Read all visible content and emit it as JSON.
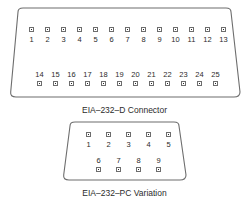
{
  "figure": {
    "name": "eia-232-connector-pinouts",
    "background_color": "#ffffff",
    "line_color": "#6d6d6d",
    "text_color": "#2b2b2b"
  },
  "connectors": [
    {
      "id": "db25",
      "caption": "EIA–232–D Connector",
      "shell_shape": "d-sub-trapezoid",
      "pin_count": 25,
      "rows": [
        {
          "id": "db25-row-top",
          "label_position": "below",
          "pins": [
            "1",
            "2",
            "3",
            "4",
            "5",
            "6",
            "7",
            "8",
            "9",
            "10",
            "11",
            "12",
            "13"
          ]
        },
        {
          "id": "db25-row-bottom",
          "label_position": "above",
          "pins": [
            "14",
            "15",
            "16",
            "17",
            "18",
            "19",
            "20",
            "21",
            "22",
            "23",
            "24",
            "25"
          ]
        }
      ]
    },
    {
      "id": "db9",
      "caption": "EIA–232–PC Variation",
      "shell_shape": "d-sub-trapezoid",
      "pin_count": 9,
      "rows": [
        {
          "id": "db9-row-top",
          "label_position": "below",
          "pins": [
            "1",
            "2",
            "3",
            "4",
            "5"
          ]
        },
        {
          "id": "db9-row-bottom",
          "label_position": "above",
          "pins": [
            "6",
            "7",
            "8",
            "9"
          ]
        }
      ]
    }
  ]
}
